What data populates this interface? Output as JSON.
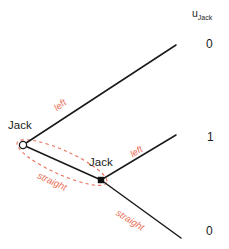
{
  "figure": {
    "type": "game-tree",
    "title": "",
    "payoff_header": {
      "symbol": "u",
      "subscript": "Jack",
      "text": "u"
    },
    "nodes": [
      {
        "id": "n1",
        "label": "Jack",
        "shape": "open-circle",
        "x": 23,
        "y": 145,
        "label_x": 8,
        "label_y": 120
      },
      {
        "id": "n2",
        "label": "Jack",
        "shape": "filled-square",
        "x": 101,
        "y": 180,
        "label_x": 89,
        "label_y": 157
      }
    ],
    "edges": [
      {
        "id": "e1",
        "from": "n1",
        "to_x": 176,
        "to_y": 45,
        "action": "left",
        "action_x": 55,
        "action_y": 104,
        "angle": -38
      },
      {
        "id": "e2",
        "from": "n1",
        "to_x": 101,
        "to_y": 180,
        "action": "straight",
        "action_x": 38,
        "action_y": 170,
        "angle": 25
      },
      {
        "id": "e3",
        "from": "n2",
        "to_x": 176,
        "to_y": 135,
        "action": "left",
        "action_x": 131,
        "action_y": 150,
        "angle": -32
      },
      {
        "id": "e4",
        "from": "n2",
        "to_x": 181,
        "to_y": 238,
        "action": "straight",
        "action_x": 117,
        "action_y": 207,
        "angle": 32
      }
    ],
    "information_set": {
      "style": "dashed-ellipse",
      "color": "#e8705a",
      "from": "n1",
      "to": "n2"
    },
    "payoffs": [
      {
        "id": "p1",
        "value": "0",
        "x": 206,
        "y": 38
      },
      {
        "id": "p2",
        "value": "1",
        "x": 207,
        "y": 131
      },
      {
        "id": "p3",
        "value": "0",
        "x": 206,
        "y": 225
      }
    ],
    "colors": {
      "line": "#1a1a1a",
      "action": "#e8705a",
      "infoset": "#e8705a",
      "text": "#1a1a1a",
      "background": "#ffffff"
    }
  }
}
